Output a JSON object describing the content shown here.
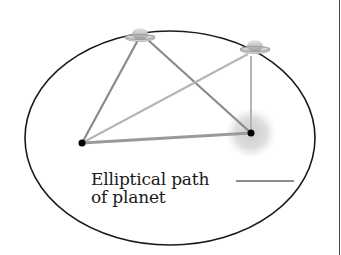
{
  "diagram": {
    "caption": {
      "line1": "Elliptical path",
      "line2": "of planet"
    },
    "elements": {
      "orbit": {
        "shape": "ellipse",
        "cx": 170,
        "cy": 138,
        "rx": 145,
        "ry": 107,
        "stroke": "#1a1a1a"
      },
      "star": {
        "label": "sun-glow",
        "cx": 251,
        "cy": 133,
        "r": 24,
        "color": "#d0d0d0"
      },
      "focus_left": {
        "cx": 82,
        "cy": 143
      },
      "focus_right": {
        "cx": 251,
        "cy": 133
      },
      "planet_positions": [
        {
          "name": "planet-position-1",
          "cx": 140,
          "cy": 36
        },
        {
          "name": "planet-position-2",
          "cx": 255,
          "cy": 48
        }
      ],
      "line_colors": {
        "dark_lines": "#8a8a8a",
        "light_lines": "#b5b5b5",
        "baseline": "#9a9a9a"
      }
    }
  }
}
